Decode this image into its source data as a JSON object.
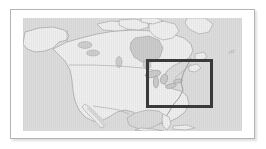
{
  "figure": {
    "kind": "locator-map",
    "caption": "",
    "frame_color": "#b4b4b4",
    "matte_color": "#ffffff"
  },
  "map": {
    "title": "North America",
    "projection_note": "",
    "ocean_color": "#d9d9d9",
    "land_color": "#ededed",
    "coastline_color": "#9a9a9a",
    "border_color": "#a8a8a8",
    "lake_color": "#c9c9c9",
    "regions": [
      "Alaska",
      "Canada",
      "Arctic Archipelago",
      "Greenland",
      "Hudson Bay",
      "United States",
      "Great Lakes",
      "Mexico",
      "Baja California",
      "Gulf of Mexico",
      "Florida",
      "Caribbean",
      "Central America"
    ]
  },
  "highlight": {
    "label": "study-area",
    "description": "Great Lakes and northeastern United States",
    "stroke_color": "#3a3a3a",
    "stroke_width_px": 3,
    "x": 123,
    "y": 41,
    "width": 67,
    "height": 49
  }
}
